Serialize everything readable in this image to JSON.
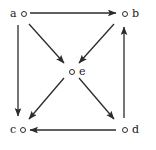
{
  "diagram": {
    "background_color": "#ffffff",
    "stroke_color": "#2b2b2b",
    "label_color": "#1a1a1a",
    "width": 156,
    "height": 150,
    "nodes": [
      {
        "id": "a",
        "label": "a",
        "label_side": "left",
        "x": 18,
        "y": 13
      },
      {
        "id": "b",
        "label": "b",
        "label_side": "right",
        "x": 124,
        "y": 13
      },
      {
        "id": "c",
        "label": "c",
        "label_side": "left",
        "x": 18,
        "y": 130
      },
      {
        "id": "d",
        "label": "d",
        "label_side": "right",
        "x": 124,
        "y": 130
      },
      {
        "id": "e",
        "label": "e",
        "label_side": "right",
        "x": 71,
        "y": 70
      }
    ],
    "edges": [
      {
        "id": "a-b",
        "from": "a",
        "to": "b",
        "shape": "straight",
        "direction": "right",
        "x1": 30,
        "y1": 13,
        "x2": 116,
        "y2": 13
      },
      {
        "id": "a-c",
        "from": "a",
        "to": "c",
        "shape": "straight",
        "direction": "down",
        "x1": 18,
        "y1": 25,
        "x2": 18,
        "y2": 116
      },
      {
        "id": "a-e",
        "from": "a",
        "to": "e",
        "shape": "straight",
        "direction": "down-right",
        "x1": 29,
        "y1": 24,
        "x2": 64,
        "y2": 63
      },
      {
        "id": "b-e",
        "from": "b",
        "to": "e",
        "shape": "straight",
        "direction": "down-left",
        "x1": 114,
        "y1": 24,
        "x2": 79,
        "y2": 63
      },
      {
        "id": "e-c",
        "from": "e",
        "to": "c",
        "shape": "straight",
        "direction": "down-left",
        "x1": 64,
        "y1": 78,
        "x2": 29,
        "y2": 119
      },
      {
        "id": "e-d",
        "from": "e",
        "to": "d",
        "shape": "straight",
        "direction": "down-right",
        "x1": 79,
        "y1": 78,
        "x2": 114,
        "y2": 119
      },
      {
        "id": "d-c",
        "from": "d",
        "to": "c",
        "shape": "straight",
        "direction": "left",
        "x1": 116,
        "y1": 130,
        "x2": 30,
        "y2": 130
      },
      {
        "id": "d-b",
        "from": "d",
        "to": "b",
        "shape": "straight",
        "direction": "up",
        "x1": 124,
        "y1": 118,
        "x2": 124,
        "y2": 27
      }
    ]
  }
}
